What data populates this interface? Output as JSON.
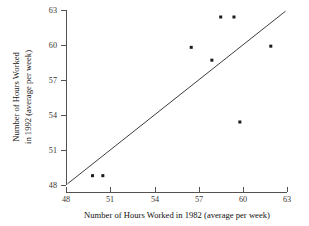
{
  "chart_data": {
    "type": "scatter",
    "title": "",
    "xlabel": "Number of Hours Worked in 1982 (average per week)",
    "ylabel_line1": "Number of Hours Worked",
    "ylabel_line2": "in 1992 (average per week)",
    "ylabel": "Number of Hours Worked in 1992 (average per week)",
    "xlim": [
      48,
      63
    ],
    "ylim": [
      48,
      63
    ],
    "xticks": [
      48,
      51,
      54,
      57,
      60,
      63
    ],
    "yticks": [
      48,
      51,
      54,
      57,
      60,
      63
    ],
    "xticklabels": [
      "48",
      "51",
      "54",
      "57",
      "60",
      "63"
    ],
    "yticklabels": [
      "48",
      "51",
      "54",
      "57",
      "60",
      "63"
    ],
    "grid": false,
    "legend": false,
    "points": [
      {
        "x": 49.8,
        "y": 48.8
      },
      {
        "x": 50.5,
        "y": 48.8
      },
      {
        "x": 56.5,
        "y": 59.8
      },
      {
        "x": 57.9,
        "y": 58.7
      },
      {
        "x": 58.5,
        "y": 62.4
      },
      {
        "x": 59.4,
        "y": 62.4
      },
      {
        "x": 59.8,
        "y": 53.4
      },
      {
        "x": 61.9,
        "y": 59.9
      }
    ],
    "reference_line": {
      "label": "y = x identity line",
      "from": {
        "x": 48.1,
        "y": 48.1
      },
      "to": {
        "x": 62.9,
        "y": 62.9
      }
    },
    "marker": {
      "shape": "square",
      "size_px": 3,
      "color": "#1a1a1a"
    },
    "line_color": "#2a2724",
    "axis_color": "#55514e"
  }
}
